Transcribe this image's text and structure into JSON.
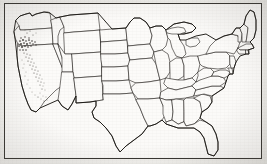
{
  "figure": {
    "kind": "map",
    "title": "Outline map of the contiguous United States",
    "caption": "",
    "frame_border_color": "#35332f",
    "background_color": "#f2f1ee",
    "map_fill_color": "#fcfbf9",
    "boundary_line_color": "#23211e",
    "coast_outline_color": "#191713",
    "shading_color": "#55514c",
    "shading_dense_color": "#3a3632",
    "has_title_text": false,
    "has_axis_labels": false,
    "has_legend": false,
    "has_scale_bar": false,
    "has_north_arrow": false,
    "projection_note": "",
    "rendering": "scanned black and white line drawing"
  },
  "map": {
    "region_name": "Contiguous United States",
    "state_count": 49,
    "includes_alaska": false,
    "includes_hawaii": false,
    "states": [
      {
        "code": "WA",
        "name": "Washington"
      },
      {
        "code": "OR",
        "name": "Oregon"
      },
      {
        "code": "CA",
        "name": "California"
      },
      {
        "code": "ID",
        "name": "Idaho"
      },
      {
        "code": "NV",
        "name": "Nevada"
      },
      {
        "code": "MT",
        "name": "Montana"
      },
      {
        "code": "WY",
        "name": "Wyoming"
      },
      {
        "code": "UT",
        "name": "Utah"
      },
      {
        "code": "AZ",
        "name": "Arizona"
      },
      {
        "code": "CO",
        "name": "Colorado"
      },
      {
        "code": "NM",
        "name": "New Mexico"
      },
      {
        "code": "ND",
        "name": "North Dakota"
      },
      {
        "code": "SD",
        "name": "South Dakota"
      },
      {
        "code": "NE",
        "name": "Nebraska"
      },
      {
        "code": "KS",
        "name": "Kansas"
      },
      {
        "code": "OK",
        "name": "Oklahoma"
      },
      {
        "code": "TX",
        "name": "Texas"
      },
      {
        "code": "MN",
        "name": "Minnesota"
      },
      {
        "code": "IA",
        "name": "Iowa"
      },
      {
        "code": "MO",
        "name": "Missouri"
      },
      {
        "code": "AR",
        "name": "Arkansas"
      },
      {
        "code": "LA",
        "name": "Louisiana"
      },
      {
        "code": "WI",
        "name": "Wisconsin"
      },
      {
        "code": "IL",
        "name": "Illinois"
      },
      {
        "code": "MI",
        "name": "Michigan"
      },
      {
        "code": "IN",
        "name": "Indiana"
      },
      {
        "code": "OH",
        "name": "Ohio"
      },
      {
        "code": "KY",
        "name": "Kentucky"
      },
      {
        "code": "TN",
        "name": "Tennessee"
      },
      {
        "code": "MS",
        "name": "Mississippi"
      },
      {
        "code": "AL",
        "name": "Alabama"
      },
      {
        "code": "GA",
        "name": "Georgia"
      },
      {
        "code": "FL",
        "name": "Florida"
      },
      {
        "code": "SC",
        "name": "South Carolina"
      },
      {
        "code": "NC",
        "name": "North Carolina"
      },
      {
        "code": "VA",
        "name": "Virginia"
      },
      {
        "code": "WV",
        "name": "West Virginia"
      },
      {
        "code": "MD",
        "name": "Maryland"
      },
      {
        "code": "DE",
        "name": "Delaware"
      },
      {
        "code": "PA",
        "name": "Pennsylvania"
      },
      {
        "code": "NJ",
        "name": "New Jersey"
      },
      {
        "code": "NY",
        "name": "New York"
      },
      {
        "code": "CT",
        "name": "Connecticut"
      },
      {
        "code": "RI",
        "name": "Rhode Island"
      },
      {
        "code": "MA",
        "name": "Massachusetts"
      },
      {
        "code": "VT",
        "name": "Vermont"
      },
      {
        "code": "NH",
        "name": "New Hampshire"
      },
      {
        "code": "ME",
        "name": "Maine"
      }
    ],
    "shaded_regions": [
      {
        "label": "Klamath / southern Cascade area at the Oregon-California border",
        "density": "dense"
      },
      {
        "label": "Sierra Nevada spine of eastern California",
        "density": "medium"
      },
      {
        "label": "Scattered marks in California Central Valley and southern California",
        "density": "light"
      }
    ]
  }
}
